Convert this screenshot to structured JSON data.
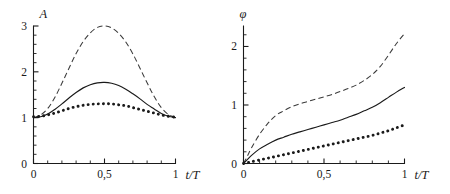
{
  "figure": {
    "background_color": "#ffffff",
    "ink_color": "#1a1a1a",
    "width": 450,
    "height": 194
  },
  "chart_data": [
    {
      "id": "amplitude-panel",
      "type": "line",
      "title": "",
      "subtitle": "",
      "xlabel": "t/T",
      "ylabel": "A",
      "xlim": [
        0,
        1
      ],
      "ylim": [
        0,
        3
      ],
      "grid": false,
      "legend": "none",
      "x_ticks_major": [
        0,
        0.5,
        1
      ],
      "x_ticklabels": [
        "0",
        "0,5",
        "1"
      ],
      "x_tick_minor_step": 0.1,
      "y_ticks_major": [
        0,
        1,
        2,
        3
      ],
      "y_ticklabels": [
        "0",
        "1",
        "2",
        "3"
      ],
      "y_tick_minor_step": 0.2,
      "x": [
        0,
        0.05,
        0.1,
        0.15,
        0.2,
        0.25,
        0.3,
        0.35,
        0.4,
        0.45,
        0.5,
        0.55,
        0.6,
        0.65,
        0.7,
        0.75,
        0.8,
        0.85,
        0.9,
        0.95,
        1
      ],
      "series": [
        {
          "name": "dashed",
          "style": "dashed",
          "values": [
            1.0,
            1.06,
            1.2,
            1.44,
            1.75,
            2.08,
            2.4,
            2.66,
            2.85,
            2.97,
            3.0,
            2.96,
            2.84,
            2.65,
            2.39,
            2.08,
            1.76,
            1.46,
            1.22,
            1.07,
            1.0
          ]
        },
        {
          "name": "solid",
          "style": "solid",
          "values": [
            1.0,
            1.02,
            1.08,
            1.18,
            1.3,
            1.43,
            1.55,
            1.65,
            1.72,
            1.76,
            1.77,
            1.75,
            1.7,
            1.62,
            1.52,
            1.41,
            1.29,
            1.19,
            1.09,
            1.03,
            1.0
          ]
        },
        {
          "name": "dotted",
          "style": "dotted",
          "values": [
            1.02,
            1.03,
            1.06,
            1.1,
            1.15,
            1.2,
            1.24,
            1.27,
            1.29,
            1.3,
            1.305,
            1.3,
            1.28,
            1.26,
            1.22,
            1.18,
            1.14,
            1.1,
            1.06,
            1.03,
            1.01
          ]
        }
      ]
    },
    {
      "id": "phase-panel",
      "type": "line",
      "title": "",
      "subtitle": "",
      "xlabel": "t/T",
      "ylabel": "φ",
      "xlim": [
        0,
        1
      ],
      "ylim": [
        0,
        2.35
      ],
      "grid": false,
      "legend": "none",
      "x_ticks_major": [
        0,
        0.5,
        1
      ],
      "x_ticklabels": [
        "0",
        "0,5",
        "1"
      ],
      "x_tick_minor_step": 0.1,
      "y_ticks_major": [
        0,
        1,
        2
      ],
      "y_ticklabels": [
        "0",
        "1",
        "2"
      ],
      "y_tick_minor_step": 0.2,
      "x": [
        0,
        0.025,
        0.05,
        0.1,
        0.15,
        0.2,
        0.25,
        0.3,
        0.35,
        0.4,
        0.45,
        0.5,
        0.55,
        0.6,
        0.65,
        0.7,
        0.75,
        0.8,
        0.85,
        0.9,
        0.95,
        1
      ],
      "series": [
        {
          "name": "dashed",
          "style": "dashed",
          "values": [
            0.0,
            0.13,
            0.27,
            0.5,
            0.68,
            0.82,
            0.9,
            0.97,
            1.02,
            1.06,
            1.1,
            1.14,
            1.18,
            1.23,
            1.28,
            1.34,
            1.42,
            1.52,
            1.66,
            1.85,
            2.05,
            2.22
          ]
        },
        {
          "name": "solid",
          "style": "solid",
          "values": [
            0.0,
            0.07,
            0.14,
            0.25,
            0.33,
            0.4,
            0.45,
            0.5,
            0.54,
            0.58,
            0.62,
            0.66,
            0.7,
            0.74,
            0.79,
            0.84,
            0.9,
            0.96,
            1.04,
            1.13,
            1.22,
            1.3
          ]
        },
        {
          "name": "dotted",
          "style": "dotted",
          "values": [
            0.0,
            0.015,
            0.03,
            0.06,
            0.09,
            0.12,
            0.15,
            0.18,
            0.21,
            0.24,
            0.27,
            0.3,
            0.33,
            0.36,
            0.39,
            0.42,
            0.45,
            0.48,
            0.52,
            0.56,
            0.61,
            0.66
          ]
        }
      ]
    }
  ]
}
